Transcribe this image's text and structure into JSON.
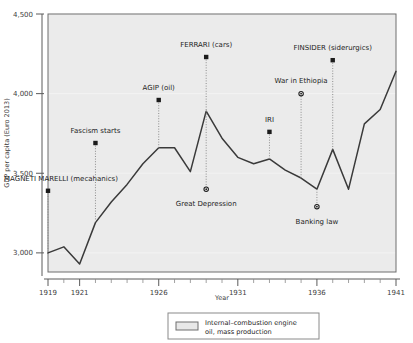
{
  "chart_data": {
    "type": "line",
    "title": "",
    "xlabel": "Year",
    "ylabel": "GDP per capita (Euro 2013)",
    "xlim": [
      1919,
      1941
    ],
    "ylim": [
      2880,
      4500
    ],
    "grid": false,
    "legend_position": "bottom-center",
    "x": [
      1919,
      1920,
      1921,
      1922,
      1923,
      1924,
      1925,
      1926,
      1927,
      1928,
      1929,
      1930,
      1931,
      1932,
      1933,
      1934,
      1935,
      1936,
      1937,
      1938,
      1939,
      1940,
      1941
    ],
    "series": [
      {
        "name": "GDP per capita (Euro 2013)",
        "values": [
          3000,
          3038,
          2930,
          3190,
          3320,
          3430,
          3560,
          3660,
          3660,
          3510,
          3890,
          3720,
          3600,
          3560,
          3590,
          3520,
          3470,
          3400,
          3650,
          3400,
          3810,
          3900,
          4140
        ]
      }
    ],
    "y_ticks": [
      3000,
      3500,
      4000,
      4500
    ],
    "y_ticklabels": [
      "3,000",
      "3,500",
      "4,000",
      "4,500"
    ],
    "x_ticks": [
      1919,
      1921,
      1926,
      1931,
      1936,
      1941
    ],
    "x_ticklabels": [
      "1919",
      "1921",
      "1926",
      "1931",
      "1936",
      "1941"
    ],
    "annotations": [
      {
        "label": "MAGNETI MARELLI (mecahanics)",
        "x": 1919,
        "marker": "square",
        "marker_y": 3390,
        "label_y": 3470,
        "align": "start"
      },
      {
        "label": "Fascism starts",
        "x": 1922,
        "marker": "square",
        "marker_y": 3690,
        "label_y": 3770,
        "align": "middle"
      },
      {
        "label": "AGIP (oil)",
        "x": 1926,
        "marker": "square",
        "marker_y": 3960,
        "label_y": 4040,
        "align": "middle"
      },
      {
        "label": "FERRARI (cars)",
        "x": 1929,
        "marker": "square",
        "marker_y": 4230,
        "label_y": 4310,
        "align": "middle"
      },
      {
        "label": "Great Depression",
        "x": 1929,
        "marker": "circle",
        "marker_y": 3400,
        "label_y": 3310,
        "align": "middle"
      },
      {
        "label": "IRI",
        "x": 1933,
        "marker": "square",
        "marker_y": 3760,
        "label_y": 3840,
        "align": "middle"
      },
      {
        "label": "War in Ethiopia",
        "x": 1935,
        "marker": "circle",
        "marker_y": 4000,
        "label_y": 4080,
        "align": "middle"
      },
      {
        "label": "Banking law",
        "x": 1936,
        "marker": "circle",
        "marker_y": 3290,
        "label_y": 3200,
        "align": "middle"
      },
      {
        "label": "FINSIDER (siderurgics)",
        "x": 1937,
        "marker": "square",
        "marker_y": 4210,
        "label_y": 4290,
        "align": "middle"
      }
    ],
    "legend": {
      "line1": "Internal–combustion engine",
      "line2": "oil, mass production"
    }
  }
}
